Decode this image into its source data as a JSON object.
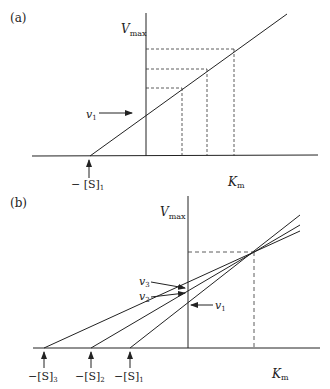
{
  "panel_a": {
    "label": "(a)",
    "y_axis_label": "V",
    "y_axis_sub": "max",
    "x_axis_label": "K",
    "x_axis_sub": "m",
    "arrow_label": "v",
    "arrow_sub": "1",
    "intercept_label": "− [S]",
    "intercept_sub": "1"
  },
  "panel_b": {
    "label": "(b)",
    "y_axis_label": "V",
    "y_axis_sub": "max",
    "x_axis_label": "K",
    "x_axis_sub": "m",
    "v_labels": [
      {
        "label": "v",
        "sub": "3"
      },
      {
        "label": "v",
        "sub": "2"
      },
      {
        "label": "v",
        "sub": "1"
      }
    ],
    "intercepts": [
      {
        "label": "−[S]",
        "sub": "3"
      },
      {
        "label": "−[S]",
        "sub": "2"
      },
      {
        "label": "−[S]",
        "sub": "1"
      }
    ]
  }
}
